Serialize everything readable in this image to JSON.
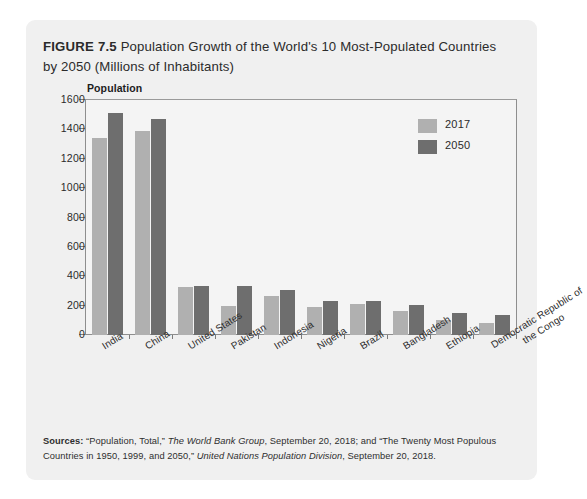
{
  "figure": {
    "number_label": "FIGURE 7.5",
    "title": " Population Growth of the World's 10 Most-Populated Countries by 2050 (Millions of Inhabitants)"
  },
  "axis_title": "Population",
  "legend": [
    {
      "label": "2017",
      "color": "#b0b0b0",
      "swatch_name": "legend-swatch-2017"
    },
    {
      "label": "2050",
      "color": "#6e6e6e",
      "swatch_name": "legend-swatch-2050"
    }
  ],
  "source": {
    "prefix": "Sources:",
    "part1": " “Population, Total,” ",
    "italic1": "The World Bank Group",
    "part2": ", September 20, 2018; and “The Twenty Most Populous Countries in 1950, 1999, and 2050,” ",
    "italic2": "United Nations Population Division",
    "part3": ", September 20, 2018."
  },
  "chart_data": {
    "type": "bar",
    "title": "Population Growth of the World's 10 Most-Populated Countries by 2050 (Millions of Inhabitants)",
    "xlabel": "",
    "ylabel": "Population",
    "ylim": [
      0,
      1600
    ],
    "yticks": [
      0,
      200,
      400,
      600,
      800,
      1000,
      1200,
      1400,
      1600
    ],
    "ytick_labels": [
      "0",
      "200",
      "400",
      "600",
      "800",
      "1000",
      "1200",
      "1400",
      "1600"
    ],
    "grid": false,
    "legend_position": "top-right",
    "categories": [
      "India",
      "China",
      "United States",
      "Pakistan",
      "Indonesia",
      "Nigeria",
      "Brazil",
      "Bangladesh",
      "Ethiopia",
      "Democratic Republic of the Congo"
    ],
    "series": [
      {
        "name": "2017",
        "color": "#b0b0b0",
        "values": [
          1339,
          1386,
          326,
          197,
          264,
          191,
          209,
          165,
          105,
          81
        ]
      },
      {
        "name": "2050",
        "color": "#6e6e6e",
        "values": [
          1513,
          1473,
          336,
          333,
          306,
          234,
          233,
          202,
          151,
          139
        ]
      }
    ]
  }
}
